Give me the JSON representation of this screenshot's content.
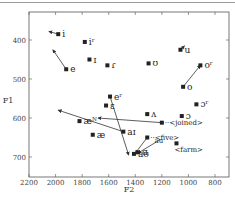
{
  "chart_data": {
    "type": "scatter",
    "title": "",
    "xlabel": "F2",
    "ylabel": "F1",
    "xlim": [
      2200,
      750
    ],
    "ylim": [
      320,
      720
    ],
    "x_reversed": true,
    "y_reversed": true,
    "xticks": [
      2200,
      2000,
      1800,
      1600,
      1400,
      1200,
      1000,
      800
    ],
    "yticks": [
      400,
      500,
      600,
      700
    ],
    "grid": false,
    "points": [
      {
        "label": "i",
        "f2": 1980,
        "f1": 385
      },
      {
        "label": "iʳ",
        "f2": 1780,
        "f1": 405
      },
      {
        "label": "ɪ",
        "f2": 1745,
        "f1": 450
      },
      {
        "label": "e",
        "f2": 1920,
        "f1": 475
      },
      {
        "label": "ɾ",
        "f2": 1610,
        "f1": 465
      },
      {
        "label": "ʊ",
        "f2": 1300,
        "f1": 460
      },
      {
        "label": "u",
        "f2": 1060,
        "f1": 425
      },
      {
        "label": "oʳ",
        "f2": 910,
        "f1": 465
      },
      {
        "label": "o",
        "f2": 1040,
        "f1": 520
      },
      {
        "label": "eʳ",
        "f2": 1590,
        "f1": 545
      },
      {
        "label": "ɛ",
        "f2": 1620,
        "f1": 568
      },
      {
        "label": "æᴺ",
        "f2": 1820,
        "f1": 608
      },
      {
        "label": "æ",
        "f2": 1720,
        "f1": 643
      },
      {
        "label": "ʌ",
        "f2": 1310,
        "f1": 590
      },
      {
        "label": "ɔʳ",
        "f2": 940,
        "f1": 565
      },
      {
        "label": "ɔ",
        "f2": 1050,
        "f1": 595
      },
      {
        "label": "aɪ",
        "f2": 1490,
        "f1": 635
      },
      {
        "label": "ɑ",
        "f2": 1380,
        "f1": 688
      },
      {
        "label": "aʊ",
        "f2": 1410,
        "f1": 692
      }
    ],
    "annotations": [
      {
        "label": "<joined>",
        "f2": 1200,
        "f1": 612
      },
      {
        "label": "<five>",
        "f2": 1310,
        "f1": 650
      },
      {
        "label": "<farm>",
        "f2": 1090,
        "f1": 665
      },
      {
        "label": "au",
        "f2": 1210,
        "f1": 660
      }
    ],
    "arrows": [
      {
        "from": [
          1980,
          385
        ],
        "to": [
          2050,
          378
        ]
      },
      {
        "from": [
          1920,
          475
        ],
        "to": [
          2020,
          425
        ]
      },
      {
        "from": [
          1060,
          425
        ],
        "to": [
          1030,
          415
        ]
      },
      {
        "from": [
          1040,
          520
        ],
        "to": [
          910,
          465
        ]
      },
      {
        "from": [
          1200,
          612
        ],
        "to": [
          1680,
          600
        ]
      },
      {
        "from": [
          1490,
          635
        ],
        "to": [
          1980,
          580
        ]
      },
      {
        "from": [
          1590,
          545
        ],
        "to": [
          1450,
          695
        ]
      },
      {
        "from": [
          1310,
          650
        ],
        "to": [
          1400,
          690
        ]
      },
      {
        "from": [
          1210,
          655
        ],
        "to": [
          1380,
          690
        ]
      }
    ]
  },
  "labels": {
    "xlabel": "F2",
    "ylabel": "F1",
    "xticks": [
      "2200",
      "2000",
      "1800",
      "1600",
      "1400",
      "1200",
      "1000",
      "800"
    ],
    "yticks": [
      "400",
      "500",
      "600",
      "700"
    ]
  }
}
